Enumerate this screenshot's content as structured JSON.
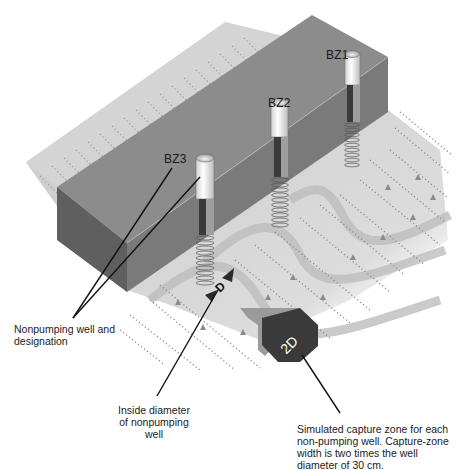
{
  "wells": [
    {
      "id": "BZ1",
      "label": "BZ1"
    },
    {
      "id": "BZ2",
      "label": "BZ2"
    },
    {
      "id": "BZ3",
      "label": "BZ3"
    }
  ],
  "symbols": {
    "diameter": "D",
    "capture_width": "2D"
  },
  "annotations": {
    "nonpumping": "Nonpumping well and designation",
    "diameter": "Inside diameter of nonpumping well",
    "capture_zone": "Simulated capture zone for each non-pumping well. Capture-zone width is two times the well diameter of 30 cm."
  },
  "colors": {
    "block_top": "#8a8a8a",
    "block_front": "#767676",
    "block_side": "#5e5e5e",
    "plane": "#d6d6d6",
    "flow_band": "#b9b9b9",
    "flow_dots": "#8c8c8c",
    "casing": "#f2f2f2",
    "casing_dark": "#3c3c3c",
    "screen": "#e6e6e6",
    "callout": "#111111"
  }
}
